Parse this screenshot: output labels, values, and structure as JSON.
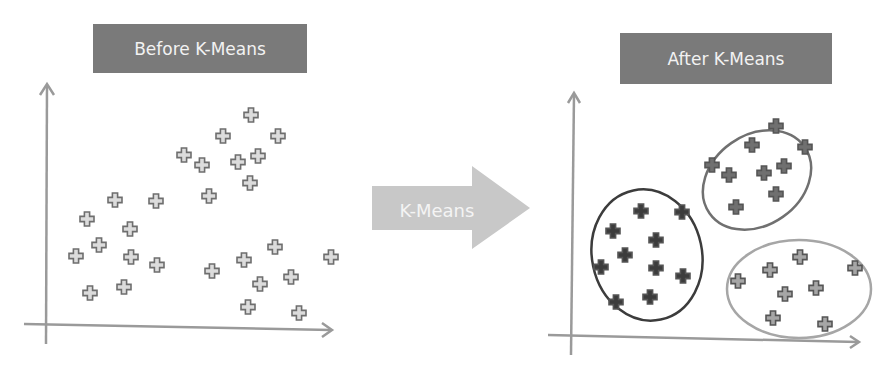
{
  "before": {
    "title": "Before K-Means",
    "points": [
      [
        184,
        155
      ],
      [
        202,
        165
      ],
      [
        223,
        136
      ],
      [
        251,
        115
      ],
      [
        278,
        136
      ],
      [
        238,
        162
      ],
      [
        258,
        156
      ],
      [
        250,
        183
      ],
      [
        209,
        196
      ],
      [
        115,
        200
      ],
      [
        156,
        201
      ],
      [
        87,
        219
      ],
      [
        130,
        229
      ],
      [
        99,
        245
      ],
      [
        131,
        257
      ],
      [
        76,
        256
      ],
      [
        157,
        265
      ],
      [
        90,
        293
      ],
      [
        124,
        287
      ],
      [
        212,
        271
      ],
      [
        244,
        260
      ],
      [
        275,
        247
      ],
      [
        260,
        284
      ],
      [
        291,
        277
      ],
      [
        248,
        307
      ],
      [
        299,
        313
      ],
      [
        331,
        257
      ]
    ]
  },
  "transition": {
    "label": "K-Means"
  },
  "after": {
    "title": "After K-Means",
    "clusters": [
      {
        "name": "cluster-top",
        "color": "#707070",
        "ellipse": [
          757,
          180,
          58,
          45,
          -35
        ],
        "points": [
          [
            776,
            126
          ],
          [
            752,
            145
          ],
          [
            805,
            147
          ],
          [
            712,
            165
          ],
          [
            729,
            175
          ],
          [
            764,
            173
          ],
          [
            784,
            166
          ],
          [
            776,
            194
          ],
          [
            736,
            207
          ]
        ]
      },
      {
        "name": "cluster-left",
        "color": "#3c3c3c",
        "ellipse": [
          647,
          255,
          55,
          66,
          -12
        ],
        "points": [
          [
            641,
            211
          ],
          [
            682,
            212
          ],
          [
            613,
            231
          ],
          [
            656,
            240
          ],
          [
            625,
            255
          ],
          [
            601,
            267
          ],
          [
            656,
            268
          ],
          [
            683,
            276
          ],
          [
            616,
            302
          ],
          [
            650,
            297
          ]
        ]
      },
      {
        "name": "cluster-right",
        "color": "#a6a6a6",
        "ellipse": [
          799,
          289,
          72,
          49,
          0
        ],
        "points": [
          [
            738,
            281
          ],
          [
            770,
            270
          ],
          [
            800,
            257
          ],
          [
            785,
            294
          ],
          [
            816,
            288
          ],
          [
            855,
            268
          ],
          [
            773,
            318
          ],
          [
            825,
            324
          ]
        ]
      }
    ]
  },
  "colors": {
    "axis": "#9a9a9a",
    "point_stroke": "#707070",
    "title_bg": "#7a7a7a",
    "arrow": "#c8c8c8"
  }
}
